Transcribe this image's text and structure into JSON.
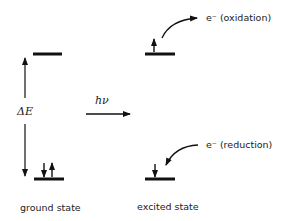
{
  "diagram": {
    "labels": {
      "delta_e": "ΔE",
      "photon": "hν",
      "oxidation": "e⁻ (oxidation)",
      "reduction": "e⁻ (reduction)",
      "ground_state": "ground state",
      "excited_state": "excited state"
    },
    "states": [
      {
        "name": "ground state",
        "upper_level_electrons": 0,
        "lower_level_electrons": 2
      },
      {
        "name": "excited state",
        "upper_level_electrons": 1,
        "lower_level_electrons": 1
      }
    ]
  }
}
